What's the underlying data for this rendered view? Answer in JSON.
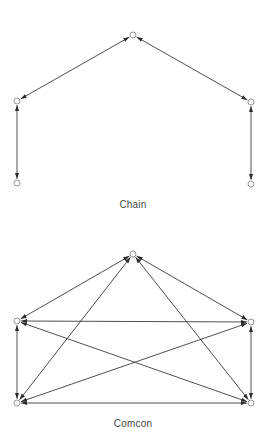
{
  "diagrams": [
    {
      "id": "chain",
      "label": "Chain",
      "label_pos": {
        "x": 133,
        "y": 199
      },
      "nodes": [
        {
          "id": "top",
          "x": 133,
          "y": 35
        },
        {
          "id": "left-mid",
          "x": 17,
          "y": 101
        },
        {
          "id": "left-bottom",
          "x": 17,
          "y": 183
        },
        {
          "id": "right-mid",
          "x": 251,
          "y": 102
        },
        {
          "id": "right-bottom",
          "x": 251,
          "y": 184
        }
      ],
      "edges": [
        {
          "from": "top",
          "to": "left-mid",
          "bidirectional": true
        },
        {
          "from": "top",
          "to": "right-mid",
          "bidirectional": true
        },
        {
          "from": "left-mid",
          "to": "left-bottom",
          "bidirectional": true
        },
        {
          "from": "right-mid",
          "to": "right-bottom",
          "bidirectional": true
        }
      ]
    },
    {
      "id": "comcon",
      "label": "Comcon",
      "label_pos": {
        "x": 133,
        "y": 418
      },
      "nodes": [
        {
          "id": "top",
          "x": 133,
          "y": 254
        },
        {
          "id": "left-mid",
          "x": 17,
          "y": 321
        },
        {
          "id": "left-bottom",
          "x": 17,
          "y": 403
        },
        {
          "id": "right-mid",
          "x": 251,
          "y": 322
        },
        {
          "id": "right-bottom",
          "x": 251,
          "y": 403
        }
      ],
      "edges": [
        {
          "from": "top",
          "to": "left-mid",
          "bidirectional": true
        },
        {
          "from": "top",
          "to": "right-mid",
          "bidirectional": true
        },
        {
          "from": "top",
          "to": "left-bottom",
          "bidirectional": true
        },
        {
          "from": "top",
          "to": "right-bottom",
          "bidirectional": true
        },
        {
          "from": "left-mid",
          "to": "right-mid",
          "bidirectional": true
        },
        {
          "from": "left-mid",
          "to": "left-bottom",
          "bidirectional": true
        },
        {
          "from": "left-mid",
          "to": "right-bottom",
          "bidirectional": true
        },
        {
          "from": "right-mid",
          "to": "left-bottom",
          "bidirectional": true
        },
        {
          "from": "right-mid",
          "to": "right-bottom",
          "bidirectional": true
        },
        {
          "from": "left-bottom",
          "to": "right-bottom",
          "bidirectional": true
        }
      ]
    }
  ],
  "style": {
    "edge_color": "#3a3a3a",
    "node_stroke": "#8a8a8a",
    "label_color": "#444444",
    "node_radius": 3
  }
}
